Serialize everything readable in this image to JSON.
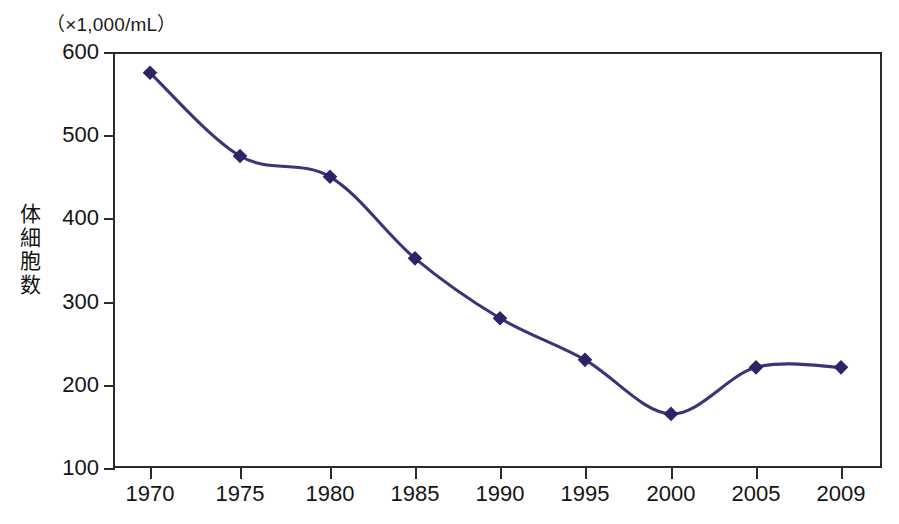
{
  "chart_data": {
    "type": "line",
    "title": "",
    "subtitle": "",
    "unit_caption": "（×1,000/mL）",
    "xlabel": "",
    "ylabel": "体細胞数",
    "ylabel_chars": [
      "体",
      "細",
      "胞",
      "数"
    ],
    "categories": [
      "1970",
      "1975",
      "1980",
      "1985",
      "1990",
      "1995",
      "2000",
      "2005",
      "2009"
    ],
    "x": [
      1970,
      1975,
      1980,
      1985,
      1990,
      1995,
      2000,
      2005,
      2009
    ],
    "values": [
      575,
      475,
      450,
      352,
      280,
      230,
      165,
      221,
      221
    ],
    "series": [
      {
        "name": "体細胞数",
        "values": [
          575,
          475,
          450,
          352,
          280,
          230,
          165,
          221,
          221
        ]
      }
    ],
    "ylim": [
      100,
      600
    ],
    "yticks": [
      600,
      500,
      400,
      300,
      200,
      100
    ],
    "ytick_labels": [
      "600",
      "500",
      "400",
      "300",
      "200",
      "100"
    ],
    "xlim": [
      1967.5,
      2011.0
    ],
    "grid": false,
    "legend": false,
    "legend_position": "none",
    "smoothing": "spline",
    "marker": "diamond",
    "colors": {
      "line": "#3b3478",
      "marker": "#2b2466",
      "axis": "#2b2b2b",
      "text": "#141414",
      "background": "#ffffff"
    },
    "annotations": []
  }
}
